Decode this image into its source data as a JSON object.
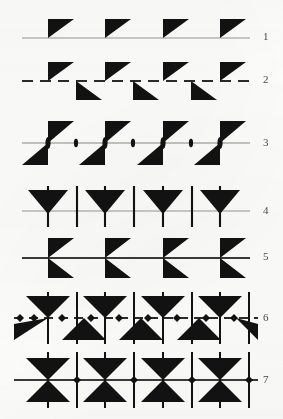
{
  "figure": {
    "background_color": "#fdfdfb",
    "ink_color": "#121212",
    "line_color_light": "#b9b9b4",
    "line_color_dark": "#3a3a3a",
    "label_color": "#4a4a4a",
    "width": 283,
    "height": 419
  },
  "rows": [
    {
      "number": "1",
      "name": "thrust-fault-teeth-above-solid-line",
      "label": "1",
      "line_style": "solid-thin-light",
      "line_x_start": 22,
      "line_x_end": 250,
      "line_y": 38,
      "marker_shape": "right-triangle-flag-up",
      "marker_side": "above",
      "marker_positions": [
        48,
        105,
        163,
        220
      ],
      "marker_width": 26,
      "marker_height": 19
    },
    {
      "number": "2",
      "name": "alternating-teeth-dashed-line",
      "label": "2",
      "line_style": "dashed",
      "line_x_start": 22,
      "line_x_end": 250,
      "line_y": 81,
      "marker_shape": "right-triangle-flag-alternating",
      "marker_side": "alternating",
      "marker_positions_above": [
        48,
        105,
        163,
        220
      ],
      "marker_positions_below": [
        76,
        133,
        191,
        248
      ],
      "marker_width": 26,
      "marker_height": 19
    },
    {
      "number": "3",
      "name": "double-teeth-with-lens-nodes-line",
      "label": "3",
      "line_style": "solid-thin-light",
      "line_x_start": 22,
      "line_x_end": 250,
      "line_y": 143,
      "marker_shape": "paired-triangles-up-down",
      "marker_side": "both",
      "marker_positions": [
        48,
        105,
        163,
        220
      ],
      "node_shape": "lens-ellipse",
      "node_positions": [
        48,
        76,
        105,
        133,
        163,
        191,
        220
      ],
      "node_sizes_major": [
        6,
        4,
        6,
        4,
        6,
        4,
        6
      ],
      "marker_width": 26,
      "marker_height": 19
    },
    {
      "number": "4",
      "name": "inverted-triangle-with-vertical-ticks",
      "label": "4",
      "line_style": "solid-thin-light",
      "line_x_start": 22,
      "line_x_end": 250,
      "line_y": 211,
      "marker_shape": "inverted-triangle-arrow",
      "marker_side": "above",
      "marker_positions": [
        48,
        105,
        163,
        220
      ],
      "tick_positions": [
        48,
        77,
        105,
        134,
        163,
        192,
        220
      ],
      "tick_top": 186,
      "tick_bottom": 228,
      "marker_width": 40,
      "marker_height": 22
    },
    {
      "number": "5",
      "name": "barbed-chevron-arrow-line",
      "label": "5",
      "line_style": "solid-medium-dark",
      "line_x_start": 22,
      "line_x_end": 250,
      "line_y": 257,
      "marker_shape": "double-barb-chevron",
      "marker_side": "both",
      "marker_positions": [
        48,
        105,
        163,
        220
      ],
      "marker_width": 26,
      "marker_height": 36
    },
    {
      "number": "6",
      "name": "double-cone-with-ticks-and-dashes",
      "label": "6",
      "line_style": "dash-dot",
      "line_x_start": 14,
      "line_x_end": 258,
      "line_y": 318,
      "marker_shape": "opposed-triangles-bowtie-vertical",
      "marker_side": "both",
      "marker_positions": [
        48,
        105,
        163,
        220
      ],
      "tick_positions": [
        48,
        77,
        105,
        134,
        163,
        192,
        220,
        249
      ],
      "node_positions": [
        20,
        34,
        62,
        91,
        119,
        148,
        177,
        206,
        234,
        248
      ],
      "tick_top": 292,
      "tick_bottom": 344,
      "marker_width": 44,
      "marker_height": 22
    },
    {
      "number": "7",
      "name": "hourglass-bowtie-with-crossbars",
      "label": "7",
      "line_style": "solid-medium-dark",
      "line_x_start": 14,
      "line_x_end": 258,
      "line_y": 380,
      "marker_shape": "hourglass-bowtie-horizontal",
      "marker_side": "both",
      "marker_positions": [
        48,
        105,
        163,
        220
      ],
      "tick_positions": [
        48,
        77,
        105,
        134,
        163,
        192,
        220,
        249
      ],
      "node_positions": [
        77,
        134,
        192,
        249
      ],
      "tick_top": 352,
      "tick_bottom": 408,
      "marker_width": 44,
      "marker_height": 46
    }
  ],
  "labels": {
    "r1": "1",
    "r2": "2",
    "r3": "3",
    "r4": "4",
    "r5": "5",
    "r6": "6",
    "r7": "7"
  }
}
